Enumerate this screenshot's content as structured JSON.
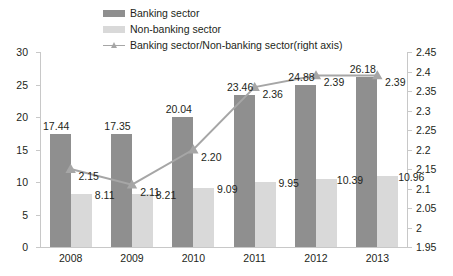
{
  "chart_data": {
    "type": "bar",
    "title": "",
    "subtitle": "",
    "xlabel": "",
    "ylabel": "",
    "categories": [
      "2008",
      "2009",
      "2010",
      "2011",
      "2012",
      "2013"
    ],
    "series": [
      {
        "name": "Banking sector",
        "type": "bar",
        "axis": "left",
        "color": "#8f8f8f",
        "values": [
          17.44,
          17.35,
          20.04,
          23.46,
          24.88,
          26.18
        ],
        "labels": [
          "17.44",
          "17.35",
          "20.04",
          "23.46",
          "24.88",
          "26.18"
        ]
      },
      {
        "name": "Non-banking sector",
        "type": "bar",
        "axis": "left",
        "color": "#d9d9d9",
        "values": [
          8.11,
          8.21,
          9.09,
          9.95,
          10.39,
          10.96
        ],
        "labels": [
          "8.11",
          "8.21",
          "9.09",
          "9.95",
          "10.39",
          "10.96"
        ]
      },
      {
        "name": "Banking sector/Non-banking sector(right axis)",
        "type": "line",
        "axis": "right",
        "color": "#a6a6a6",
        "marker": "triangle",
        "values": [
          2.15,
          2.11,
          2.2,
          2.36,
          2.39,
          2.39
        ],
        "labels": [
          "2.15",
          "2.11",
          "2.20",
          "2.36",
          "2.39",
          "2.39"
        ]
      }
    ],
    "left_axis": {
      "ylim": [
        0,
        30
      ],
      "ticks": [
        0,
        5,
        10,
        15,
        20,
        25,
        30
      ],
      "ticklabels": [
        "0",
        "5",
        "10",
        "15",
        "20",
        "25",
        "30"
      ]
    },
    "right_axis": {
      "ylim": [
        1.95,
        2.45
      ],
      "ticks": [
        1.95,
        2.0,
        2.05,
        2.1,
        2.15,
        2.2,
        2.25,
        2.3,
        2.35,
        2.4,
        2.45
      ],
      "ticklabels": [
        "1.95",
        "2",
        "2.05",
        "2.1",
        "2.15",
        "2.2",
        "2.25",
        "2.3",
        "2.35",
        "2.4",
        "2.45"
      ]
    },
    "grid": false,
    "legend_position": "top-center",
    "background": "#ffffff"
  },
  "legend": {
    "items": [
      {
        "label": "Banking sector",
        "kind": "swatch",
        "color": "#8f8f8f"
      },
      {
        "label": "Non-banking sector",
        "kind": "swatch",
        "color": "#d9d9d9"
      },
      {
        "label": "Banking sector/Non-banking sector(right axis)",
        "kind": "line",
        "color": "#a6a6a6"
      }
    ]
  }
}
